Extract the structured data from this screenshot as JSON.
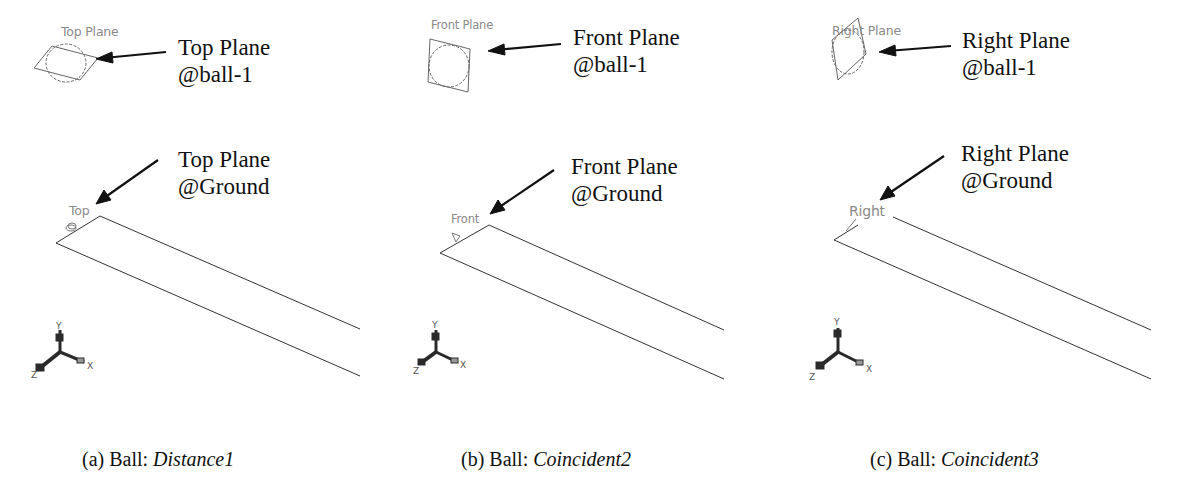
{
  "figure": {
    "panels": [
      {
        "id": "a",
        "cad_plane_label": "Top Plane",
        "cad_ground_label": "Top",
        "callout_top": [
          "Top Plane",
          "@ball-1"
        ],
        "callout_bottom": [
          "Top Plane",
          "@Ground"
        ],
        "caption_prefix": "(a) Ball: ",
        "caption_mate": "Distance1"
      },
      {
        "id": "b",
        "cad_plane_label": "Front Plane",
        "cad_ground_label": "Front",
        "callout_top": [
          "Front Plane",
          "@ball-1"
        ],
        "callout_bottom": [
          "Front Plane",
          "@Ground"
        ],
        "caption_prefix": "(b) Ball: ",
        "caption_mate": "Coincident2"
      },
      {
        "id": "c",
        "cad_plane_label": "Right Plane",
        "cad_ground_label": "Right",
        "callout_top": [
          "Right Plane",
          "@ball-1"
        ],
        "callout_bottom": [
          "Right Plane",
          "@Ground"
        ],
        "caption_prefix": "(c) Ball: ",
        "caption_mate": "Coincident3"
      }
    ],
    "triad_axes": {
      "x": "X",
      "y": "Y",
      "z": "Z"
    },
    "colors": {
      "text": "#111111",
      "cad_label": "#8a8a8a",
      "line": "#333333",
      "triad": "#2a2a2a"
    }
  }
}
